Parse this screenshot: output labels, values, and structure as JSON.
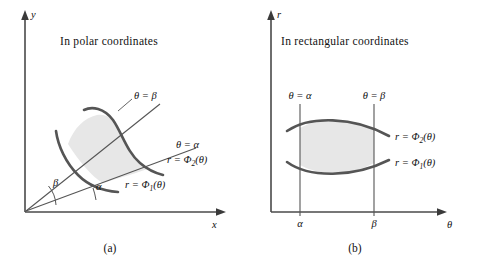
{
  "figure": {
    "panels": [
      {
        "id": "a",
        "caption": "(a)",
        "heading": "In polar coordinates",
        "axes": {
          "vertical_label": "y",
          "horizontal_label": "x"
        },
        "labels": {
          "theta_beta": "θ = β",
          "theta_alpha": "θ = α",
          "r_phi2_prefix": "r = Φ",
          "r_phi2_sub": "2",
          "r_phi2_suffix": "(θ)",
          "r_phi1_prefix": "r = Φ",
          "r_phi1_sub": "1",
          "r_phi1_suffix": "(θ)",
          "angle_alpha": "α",
          "angle_beta": "β"
        }
      },
      {
        "id": "b",
        "caption": "(b)",
        "heading": "In rectangular coordinates",
        "axes": {
          "vertical_label": "r",
          "horizontal_label": "θ"
        },
        "labels": {
          "theta_alpha": "θ = α",
          "theta_beta": "θ = β",
          "r_phi2_prefix": "r = Φ",
          "r_phi2_sub": "2",
          "r_phi2_suffix": "(θ)",
          "r_phi1_prefix": "r = Φ",
          "r_phi1_sub": "1",
          "r_phi1_suffix": "(θ)",
          "tick_alpha": "α",
          "tick_beta": "β"
        }
      }
    ],
    "colors": {
      "region_fill": "#e7e7e7",
      "curve_stroke": "#555555",
      "axis_stroke": "#4a4a4a",
      "background": "#ffffff",
      "text": "#111111"
    }
  }
}
